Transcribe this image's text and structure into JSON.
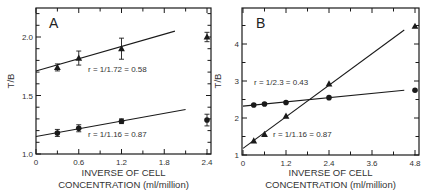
{
  "chart_data": [
    {
      "type": "scatter",
      "panel": "A",
      "title": "A",
      "xlabel": "INVERSE OF CELL CONCENTRATION (ml/million)",
      "xlabel_lines": [
        "INVERSE OF CELL",
        "CONCENTRATION (ml/million)"
      ],
      "ylabel": "T/B",
      "xlim": [
        0,
        2.45
      ],
      "ylim": [
        1.0,
        2.25
      ],
      "xticks": [
        0,
        0.6,
        1.2,
        1.8,
        2.4
      ],
      "xtick_labels": [
        "0",
        "0.6",
        "1.2",
        "1.8",
        "2.4"
      ],
      "yticks": [
        1.0,
        1.5,
        2.0
      ],
      "ytick_labels": [
        "1.0",
        "1.5",
        "2.0"
      ],
      "grid": false,
      "series": [
        {
          "name": "triangles",
          "marker": "triangle",
          "x": [
            0.3,
            0.6,
            1.2,
            2.4
          ],
          "y": [
            1.74,
            1.82,
            1.9,
            2.0
          ],
          "yerr": [
            0.03,
            0.06,
            0.09,
            0.04
          ],
          "fit": {
            "x0": 0,
            "y0": 1.71,
            "x1": 1.95,
            "y1": 2.05
          },
          "annotation": "r = 1/1.72 = 0.58"
        },
        {
          "name": "circles",
          "marker": "circle",
          "x": [
            0.3,
            0.6,
            1.2,
            2.4
          ],
          "y": [
            1.18,
            1.22,
            1.28,
            1.29
          ],
          "yerr": [
            0.03,
            0.03,
            0.02,
            0.05
          ],
          "fit": {
            "x0": 0,
            "y0": 1.15,
            "x1": 2.1,
            "y1": 1.38
          },
          "annotation": "r = 1/1.16 = 0.87"
        }
      ]
    },
    {
      "type": "scatter",
      "panel": "B",
      "title": "B",
      "xlabel": "INVERSE OF CELL CONCENTRATION (ml/million)",
      "xlabel_lines": [
        "INVERSE OF CELL",
        "CONCENTRATION (ml/million)"
      ],
      "ylabel": "T/B",
      "xlim": [
        0,
        4.9
      ],
      "ylim": [
        1,
        4.9
      ],
      "xticks": [
        0,
        1.2,
        2.4,
        3.6,
        4.8
      ],
      "xtick_labels": [
        "0",
        "1.2",
        "2.4",
        "3.6",
        "4.8"
      ],
      "yticks": [
        1,
        2,
        3,
        4
      ],
      "ytick_labels": [
        "1",
        "2",
        "3",
        "4"
      ],
      "grid": false,
      "series": [
        {
          "name": "circles",
          "marker": "circle",
          "x": [
            0.3,
            0.6,
            1.2,
            2.4,
            4.8
          ],
          "y": [
            2.35,
            2.38,
            2.42,
            2.55,
            2.75
          ],
          "fit": {
            "x0": 0,
            "y0": 2.32,
            "x1": 4.5,
            "y1": 2.75
          },
          "annotation": "r = 1/2.3 = 0.43"
        },
        {
          "name": "triangles",
          "marker": "triangle",
          "x": [
            0.3,
            0.6,
            1.2,
            2.4,
            4.8
          ],
          "y": [
            1.38,
            1.56,
            2.05,
            2.92,
            4.48
          ],
          "fit": {
            "x0": 0,
            "y0": 1.18,
            "x1": 4.5,
            "y1": 4.38
          },
          "annotation": "r = 1/1.16 = 0.87"
        }
      ]
    }
  ]
}
